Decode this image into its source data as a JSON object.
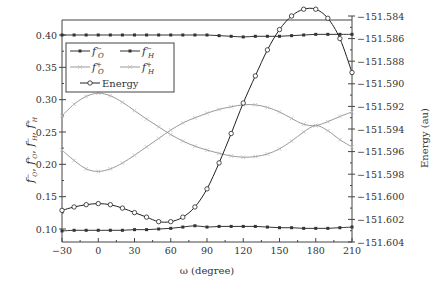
{
  "chart_data": {
    "type": "line",
    "title": "",
    "xlabel": "ω (degree)",
    "ylabel_left": "f⁻O, f⁺O, f⁻H, f⁺H",
    "ylabel_right": "Energy (au)",
    "xlim": [
      -30,
      210
    ],
    "ylim_left": [
      0.08,
      0.42
    ],
    "ylim_right": [
      -151.604,
      -151.584
    ],
    "x_ticks": [
      "-30",
      "0",
      "30",
      "60",
      "90",
      "120",
      "150",
      "180",
      "210"
    ],
    "y_left_ticks": [
      "0.10",
      "0.15",
      "0.20",
      "0.25",
      "0.30",
      "0.35",
      "0.40"
    ],
    "y_right_ticks": [
      "-151.584",
      "-151.586",
      "-151.588",
      "-151.590",
      "-151.592",
      "-151.594",
      "-151.596",
      "-151.598",
      "-151.600",
      "-151.602",
      "-151.604"
    ],
    "grid": false,
    "legend_position": "upper left",
    "x": [
      -30,
      -20,
      -10,
      0,
      10,
      20,
      30,
      40,
      50,
      60,
      70,
      80,
      90,
      100,
      110,
      120,
      130,
      140,
      150,
      160,
      170,
      180,
      190,
      200,
      210
    ],
    "series": [
      {
        "name": "f⁻O",
        "axis": "left",
        "marker": "filled-square",
        "color": "#333333",
        "values": [
          0.4,
          0.4,
          0.4,
          0.4,
          0.4,
          0.4,
          0.4,
          0.4,
          0.4,
          0.4,
          0.4,
          0.4,
          0.4,
          0.399,
          0.398,
          0.397,
          0.398,
          0.398,
          0.398,
          0.399,
          0.4,
          0.401,
          0.401,
          0.401,
          0.401
        ]
      },
      {
        "name": "f⁻H",
        "axis": "left",
        "marker": "filled-square",
        "color": "#333333",
        "values": [
          0.097,
          0.098,
          0.098,
          0.098,
          0.098,
          0.098,
          0.099,
          0.099,
          0.1,
          0.101,
          0.103,
          0.105,
          0.103,
          0.104,
          0.104,
          0.104,
          0.104,
          0.103,
          0.102,
          0.102,
          0.101,
          0.101,
          0.101,
          0.102,
          0.103
        ]
      },
      {
        "name": "f⁺O",
        "axis": "left",
        "marker": "x",
        "color": "#999999",
        "values": [
          0.275,
          0.293,
          0.305,
          0.31,
          0.306,
          0.296,
          0.283,
          0.27,
          0.258,
          0.246,
          0.236,
          0.228,
          0.222,
          0.217,
          0.213,
          0.211,
          0.212,
          0.216,
          0.224,
          0.236,
          0.25,
          0.26,
          0.252,
          0.238,
          0.227
        ]
      },
      {
        "name": "f⁺H",
        "axis": "left",
        "marker": "x",
        "color": "#999999",
        "values": [
          0.222,
          0.206,
          0.193,
          0.189,
          0.193,
          0.202,
          0.214,
          0.227,
          0.24,
          0.253,
          0.264,
          0.272,
          0.279,
          0.285,
          0.289,
          0.292,
          0.292,
          0.288,
          0.281,
          0.271,
          0.262,
          0.26,
          0.266,
          0.274,
          0.281
        ]
      },
      {
        "name": "Energy",
        "axis": "right",
        "marker": "open-circle",
        "color": "#222222",
        "values": [
          -151.6012,
          -151.6009,
          -151.6007,
          -151.6006,
          -151.6007,
          -151.601,
          -151.6014,
          -151.6018,
          -151.6022,
          -151.6022,
          -151.6018,
          -151.6009,
          -151.5993,
          -151.597,
          -151.5944,
          -151.5917,
          -151.5893,
          -151.587,
          -151.5852,
          -151.584,
          -151.5834,
          -151.5834,
          -151.5842,
          -151.586,
          -151.589
        ]
      }
    ]
  },
  "legend": {
    "items": [
      {
        "label": "f⁻O",
        "base": "f",
        "sup": "−",
        "sub": "O",
        "style": "dark-square"
      },
      {
        "label": "f⁻H",
        "base": "f",
        "sup": "−",
        "sub": "H",
        "style": "dark-square"
      },
      {
        "label": "f⁺O",
        "base": "f",
        "sup": "+",
        "sub": "O",
        "style": "gray-x"
      },
      {
        "label": "f⁺H",
        "base": "f",
        "sup": "+",
        "sub": "H",
        "style": "gray-x"
      },
      {
        "label": "Energy",
        "style": "dark-circle"
      }
    ]
  },
  "axes": {
    "xlabel": "ω (degree)",
    "ylabel_right": "Energy (au)",
    "ylabel_left": "f⁻O, f⁺O, f⁻H, f⁺H"
  }
}
